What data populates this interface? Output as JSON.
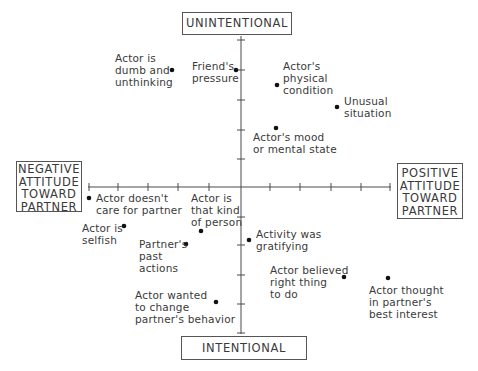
{
  "diagram": {
    "axes": {
      "vertical": {
        "top_label": "UNINTENTIONAL",
        "bottom_label": "INTENTIONAL"
      },
      "horizontal": {
        "left_label": [
          "NEGATIVE",
          "ATTITUDE",
          "TOWARD",
          "PARTNER"
        ],
        "right_label": [
          "POSITIVE",
          "ATTITUDE",
          "TOWARD",
          "PARTNER"
        ]
      },
      "tick_count_each_side": 5
    },
    "points": [
      {
        "id": "dumb",
        "lines": [
          "Actor is",
          "dumb and",
          "unthinking"
        ]
      },
      {
        "id": "friend",
        "lines": [
          "Friend's",
          "pressure"
        ]
      },
      {
        "id": "physical",
        "lines": [
          "Actor's",
          "physical",
          "condition"
        ]
      },
      {
        "id": "unusual",
        "lines": [
          "Unusual",
          "situation"
        ]
      },
      {
        "id": "mood",
        "lines": [
          "Actor's mood",
          "or mental state"
        ]
      },
      {
        "id": "doesnt-care",
        "lines": [
          "Actor doesn't",
          "care for partner"
        ]
      },
      {
        "id": "selfish",
        "lines": [
          "Actor is",
          "selfish"
        ]
      },
      {
        "id": "kind-of-person",
        "lines": [
          "Actor is",
          "that kind",
          "of person"
        ]
      },
      {
        "id": "past-actions",
        "lines": [
          "Partner's",
          "past",
          "actions"
        ]
      },
      {
        "id": "gratifying",
        "lines": [
          "Activity was",
          "gratifying"
        ]
      },
      {
        "id": "right-thing",
        "lines": [
          "Actor believed",
          "right thing",
          "to do"
        ]
      },
      {
        "id": "best-interest",
        "lines": [
          "Actor thought",
          "in partner's",
          "best interest"
        ]
      },
      {
        "id": "change-behavior",
        "lines": [
          "Actor wanted",
          "to change",
          "partner's behavior"
        ]
      }
    ]
  }
}
